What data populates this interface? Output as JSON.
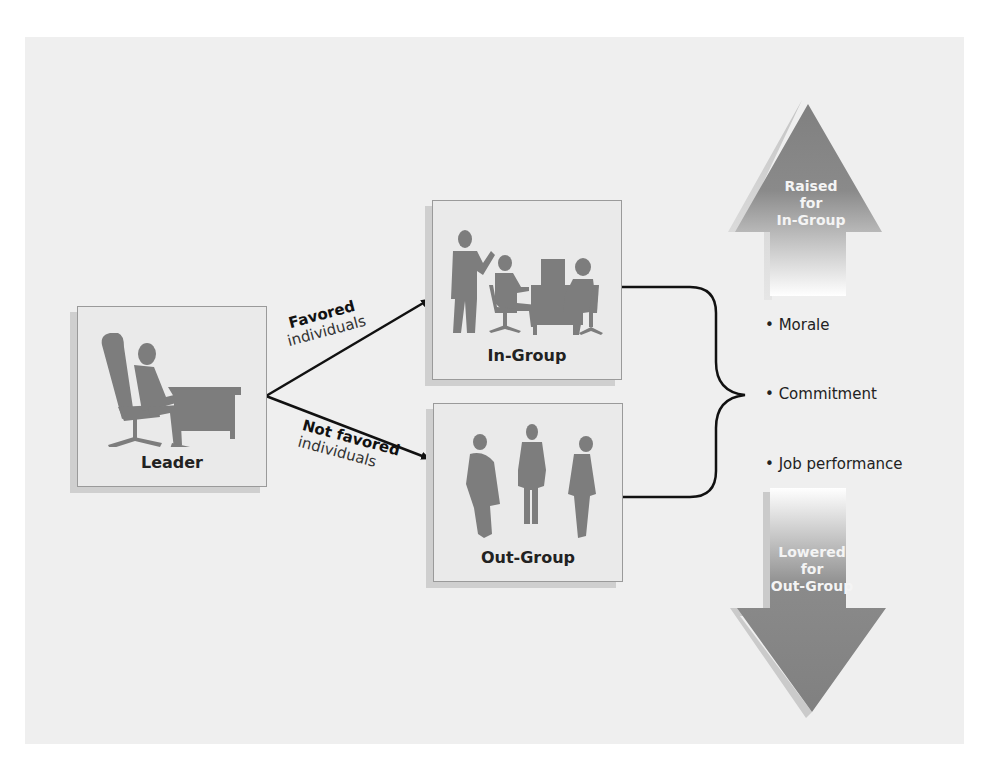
{
  "diagram": {
    "type": "leader-member-exchange",
    "leader": {
      "label": "Leader",
      "icon": "seated-leader-at-desk-icon"
    },
    "edges": [
      {
        "bold": "Favored",
        "light": "individuals",
        "to": "In-Group"
      },
      {
        "bold": "Not favored",
        "light": "individuals",
        "to": "Out-Group"
      }
    ],
    "in_group": {
      "label": "In-Group",
      "icon": "office-team-icon"
    },
    "out_group": {
      "label": "Out-Group",
      "icon": "three-standing-people-icon"
    },
    "outcomes": [
      {
        "label": "Morale"
      },
      {
        "label": "Commitment"
      },
      {
        "label": "Job performance"
      }
    ],
    "up_arrow": {
      "lines": [
        "Raised",
        "for",
        "In-Group"
      ]
    },
    "down_arrow": {
      "lines": [
        "Lowered",
        "for",
        "Out-Group"
      ]
    }
  },
  "colors": {
    "panel": "#efefef",
    "box": "#eaeaea",
    "silhouette": "#7d7d7d",
    "arrow": "#808080",
    "arrow_shadow": "#c8c8c8",
    "line": "#111111"
  }
}
